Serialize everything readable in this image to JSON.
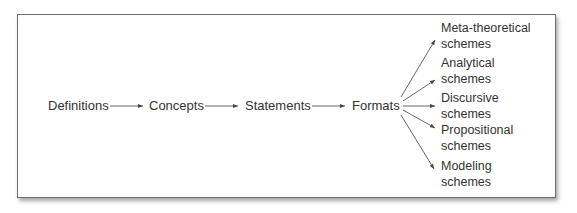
{
  "diagram": {
    "type": "flowchart",
    "chain": [
      {
        "id": "definitions",
        "label": "Definitions"
      },
      {
        "id": "concepts",
        "label": "Concepts"
      },
      {
        "id": "statements",
        "label": "Statements"
      },
      {
        "id": "formats",
        "label": "Formats"
      }
    ],
    "branches": [
      {
        "id": "meta-theoretical",
        "line1": "Meta-theoretical",
        "line2": "schemes"
      },
      {
        "id": "analytical",
        "line1": "Analytical",
        "line2": "schemes"
      },
      {
        "id": "discursive",
        "line1": "Discursive",
        "line2": "schemes"
      },
      {
        "id": "propositional",
        "line1": "Propositional",
        "line2": "schemes"
      },
      {
        "id": "modeling",
        "line1": "Modeling",
        "line2": "schemes"
      }
    ],
    "edges": [
      [
        "definitions",
        "concepts"
      ],
      [
        "concepts",
        "statements"
      ],
      [
        "statements",
        "formats"
      ],
      [
        "formats",
        "meta-theoretical"
      ],
      [
        "formats",
        "analytical"
      ],
      [
        "formats",
        "discursive"
      ],
      [
        "formats",
        "propositional"
      ],
      [
        "formats",
        "modeling"
      ]
    ],
    "colors": {
      "line": "#444444",
      "text": "#333333",
      "border": "#6e6e6e"
    }
  }
}
